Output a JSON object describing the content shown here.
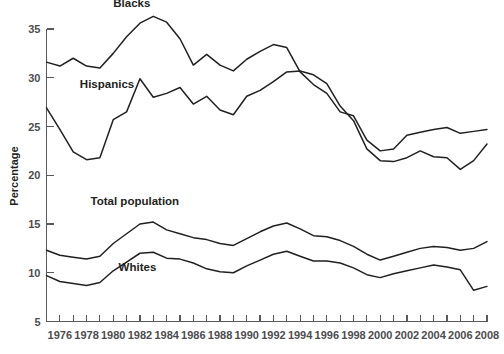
{
  "figure": {
    "caption_partial": ""
  },
  "axis": {
    "y_title": "Percentage",
    "y_ticks": [
      "5",
      "10",
      "15",
      "20",
      "25",
      "30",
      "35"
    ],
    "x_ticks": [
      "1976",
      "1978",
      "1980",
      "1982",
      "1984",
      "1986",
      "1988",
      "1990",
      "1992",
      "1994",
      "1996",
      "1998",
      "2000",
      "2002",
      "2004",
      "2006",
      "2008"
    ]
  },
  "series_labels": {
    "blacks": "Blacks",
    "hispanics": "Hispanics",
    "total": "Total population",
    "whites": "Whites"
  },
  "colors": {
    "line": "#231f20",
    "axis": "#58595b",
    "label": "#4d4d4f",
    "background": "#ffffff"
  },
  "chart_data": {
    "type": "line",
    "title": "",
    "subtitle": "",
    "xlabel": "",
    "ylabel": "Percentage",
    "xlim": [
      1975,
      2008
    ],
    "ylim": [
      5,
      35
    ],
    "grid": false,
    "legend": "inline-labels",
    "x": [
      1975,
      1976,
      1977,
      1978,
      1979,
      1980,
      1981,
      1982,
      1983,
      1984,
      1985,
      1986,
      1987,
      1988,
      1989,
      1990,
      1991,
      1992,
      1993,
      1994,
      1995,
      1996,
      1997,
      1998,
      1999,
      2000,
      2001,
      2002,
      2003,
      2004,
      2005,
      2006,
      2007,
      2008
    ],
    "series": [
      {
        "name": "Blacks",
        "values": [
          31.6,
          31.2,
          32.0,
          31.2,
          31.0,
          32.5,
          34.2,
          35.6,
          36.3,
          35.7,
          34.0,
          31.3,
          32.4,
          31.3,
          30.7,
          31.9,
          32.7,
          33.4,
          33.1,
          30.6,
          29.3,
          28.4,
          26.5,
          26.1,
          23.6,
          22.5,
          22.7,
          24.1,
          24.4,
          24.7,
          24.9,
          24.3,
          24.5,
          24.7
        ]
      },
      {
        "name": "Hispanics",
        "values": [
          26.9,
          24.7,
          22.4,
          21.6,
          21.8,
          25.7,
          26.5,
          29.9,
          28.0,
          28.4,
          29.0,
          27.3,
          28.1,
          26.7,
          26.2,
          28.1,
          28.7,
          29.6,
          30.6,
          30.7,
          30.3,
          29.4,
          27.1,
          25.6,
          22.7,
          21.5,
          21.4,
          21.8,
          22.5,
          21.9,
          21.8,
          20.6,
          21.5,
          23.2
        ]
      },
      {
        "name": "Total population",
        "values": [
          12.3,
          11.8,
          11.6,
          11.4,
          11.7,
          13.0,
          14.0,
          15.0,
          15.2,
          14.4,
          14.0,
          13.6,
          13.4,
          13.0,
          12.8,
          13.5,
          14.2,
          14.8,
          15.1,
          14.5,
          13.8,
          13.7,
          13.3,
          12.7,
          11.9,
          11.3,
          11.7,
          12.1,
          12.5,
          12.7,
          12.6,
          12.3,
          12.5,
          13.2
        ]
      },
      {
        "name": "Whites",
        "values": [
          9.7,
          9.1,
          8.9,
          8.7,
          9.0,
          10.2,
          11.1,
          12.0,
          12.1,
          11.5,
          11.4,
          11.0,
          10.4,
          10.1,
          10.0,
          10.7,
          11.3,
          11.9,
          12.2,
          11.7,
          11.2,
          11.2,
          11.0,
          10.5,
          9.8,
          9.5,
          9.9,
          10.2,
          10.5,
          10.8,
          10.6,
          10.3,
          8.2,
          8.6
        ]
      }
    ],
    "annotations": [
      {
        "text": "Blacks",
        "x": 1980.0,
        "y": 37.3
      },
      {
        "text": "Hispanics",
        "x": 1977.5,
        "y": 29.0
      },
      {
        "text": "Total population",
        "x": 1978.3,
        "y": 16.9
      },
      {
        "text": "Whites",
        "x": 1980.4,
        "y": 10.2
      }
    ]
  }
}
